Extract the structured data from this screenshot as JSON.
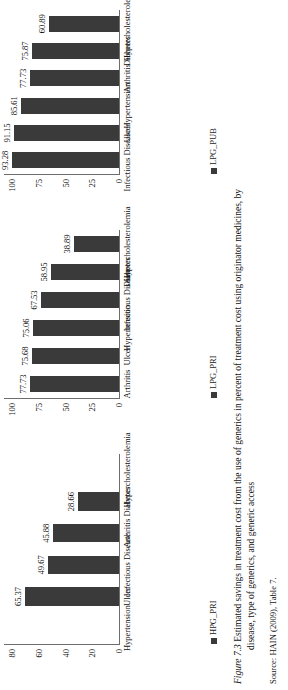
{
  "figure": {
    "caption_number": "Figure 7.3",
    "caption_line1": "Estimated savings in treatment cost from the use of generics in percent of treatment cost using originator medicines, by",
    "caption_line2": "disease, type of generics, and generic access",
    "source": "Source: HAIN (2009), Table 7."
  },
  "colors": {
    "bar": "#3a3a3a",
    "axis": "#6d6d6d",
    "text": "#111111",
    "background": "#ffffff"
  },
  "chart_data": [
    {
      "type": "bar",
      "id": "hpg-pri",
      "legend": "HPG_PRI",
      "categories": [
        "Hypertension",
        "Ulcer",
        "Infectious Disease",
        "Arthritis",
        "Diabetes",
        "Hypercholesterolemia"
      ],
      "values": [
        null,
        65.37,
        49.67,
        45.88,
        28.66,
        null
      ],
      "value_labels": [
        "",
        "65.37",
        "49.67",
        "45.88",
        "28.66",
        ""
      ],
      "ticks": [
        "0",
        "20",
        "40",
        "60",
        "80"
      ],
      "ylim": [
        0,
        80
      ],
      "xlabel": "",
      "ylabel": "",
      "grid": false,
      "legend_position": "bottom-left"
    },
    {
      "type": "bar",
      "id": "lpg-pri",
      "legend": "LPG_PRI",
      "categories": [
        "Arthritis",
        "Ulcer",
        "Hypertension",
        "Infectious Disease",
        "Diabetes",
        "Hypercholesterolemia"
      ],
      "values": [
        77.73,
        75.68,
        75.06,
        67.53,
        58.95,
        38.89
      ],
      "value_labels": [
        "77.73",
        "75.68",
        "75.06",
        "67.53",
        "58.95",
        "38.89"
      ],
      "ticks": [
        "0",
        "25",
        "50",
        "75",
        "100"
      ],
      "ylim": [
        0,
        100
      ],
      "xlabel": "",
      "ylabel": "",
      "grid": false,
      "legend_position": "bottom-left"
    },
    {
      "type": "bar",
      "id": "lpg-pub",
      "legend": "LPG_PUB",
      "categories": [
        "Infectious Disease",
        "Ulcer",
        "Hypertension",
        "Arthritis",
        "Diabetes",
        "Hypercholesterolemia"
      ],
      "values": [
        93.28,
        91.15,
        85.61,
        77.73,
        75.87,
        60.89
      ],
      "value_labels": [
        "93.28",
        "91.15",
        "85.61",
        "77.73",
        "75.87",
        "60.89"
      ],
      "ticks": [
        "0",
        "25",
        "50",
        "75",
        "100"
      ],
      "ylim": [
        0,
        100
      ],
      "xlabel": "",
      "ylabel": "",
      "grid": false,
      "legend_position": "bottom-left"
    }
  ]
}
